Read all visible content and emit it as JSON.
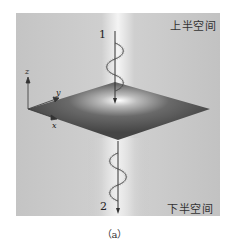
{
  "figure": {
    "caption": "（a）",
    "labels": {
      "upper_half_space": "上半空间",
      "lower_half_space": "下半空间",
      "wave_1": "1",
      "wave_2": "2",
      "axis_z": "z",
      "axis_y": "y",
      "axis_x": "x"
    },
    "colors": {
      "background": "#bdbdbd",
      "plane_dark": "#4a4a4a",
      "plane_light": "#ffffff",
      "beam_glow": "#f2f2f2",
      "line": "#333333"
    }
  }
}
